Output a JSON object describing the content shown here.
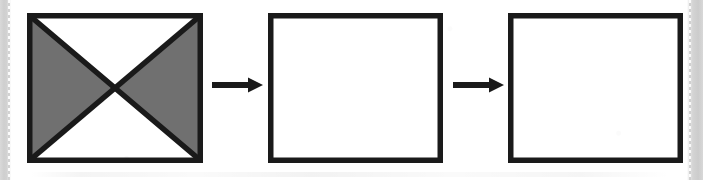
{
  "figure": {
    "kind": "visual-analogy-sequence",
    "orientation": "horizontal",
    "colors": {
      "stroke": "#1a1a1a",
      "shade_fill": "#707070",
      "blank_fill": "#ffffff",
      "paper": "#ffffff",
      "page_edge": "#d2d2d2"
    },
    "stroke_width_px": 5,
    "panel_count": 3,
    "arrow_count": 2
  },
  "panels": [
    {
      "index": 1,
      "name": "shaded-x-square",
      "shape": "square",
      "border": "thick-black",
      "internal_lines": "two-diagonals-forming-x",
      "fill_pattern": "left-and-right-triangles-shaded",
      "shaded_regions": [
        "west",
        "east"
      ],
      "blank_regions": [
        "north",
        "south"
      ],
      "fill_color": "#707070",
      "caption": "",
      "width_px": 176,
      "height_px": 150
    },
    {
      "index": 2,
      "name": "empty-square-1",
      "shape": "square",
      "border": "thick-black",
      "internal_lines": "none",
      "fill_pattern": "empty",
      "shaded_regions": [],
      "blank_regions": [
        "whole"
      ],
      "fill_color": "#ffffff",
      "caption": "",
      "width_px": 175,
      "height_px": 150
    },
    {
      "index": 3,
      "name": "empty-square-2",
      "shape": "square",
      "border": "thick-black",
      "internal_lines": "none",
      "fill_pattern": "empty",
      "shaded_regions": [],
      "blank_regions": [
        "whole"
      ],
      "fill_color": "#ffffff",
      "caption": "",
      "width_px": 175,
      "height_px": 150
    }
  ],
  "arrows": [
    {
      "index": 1,
      "name": "arrow-panel1-to-panel2",
      "direction": "right",
      "glyph": "→",
      "label": ""
    },
    {
      "index": 2,
      "name": "arrow-panel2-to-panel3",
      "direction": "right",
      "glyph": "→",
      "label": ""
    }
  ]
}
